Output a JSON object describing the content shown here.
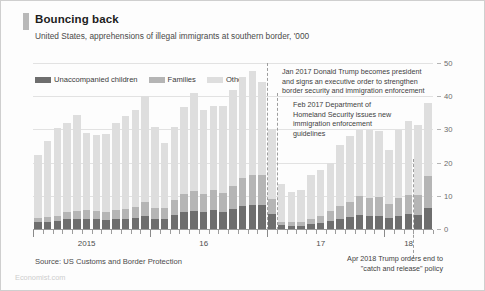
{
  "header": {
    "title": "Bouncing back",
    "subtitle": "United States, apprehensions of illegal immigrants at southern border, '000"
  },
  "legend": {
    "items": [
      {
        "label": "Unaccompanied children",
        "color": "#6e6e6e"
      },
      {
        "label": "Families",
        "color": "#b5b5b5"
      },
      {
        "label": "Other",
        "color": "#dedede"
      }
    ]
  },
  "annotations": [
    {
      "name": "jan-2017",
      "text": "Jan 2017 Donald Trump becomes president and signs an executive order to strengthen border security and immigration enforcement"
    },
    {
      "name": "feb-2017",
      "text": "Feb 2017 Department of Homeland Security issues new immigration enforcement guidelines"
    },
    {
      "name": "apr-2018",
      "text": "Apr 2018 Trump orders end to \"catch and release\" policy"
    }
  ],
  "source": "Source: US Customs and Border Protection",
  "brand": "Economist.com",
  "chart_data": {
    "type": "bar",
    "subtype": "stacked-column",
    "title": "Bouncing back",
    "subtitle": "United States, apprehensions of illegal immigrants at southern border, '000",
    "xlabel": "",
    "ylabel": "'000",
    "ylim": [
      0,
      50
    ],
    "yticks": [
      0,
      10,
      20,
      30,
      40,
      50
    ],
    "yaxis_position": "right",
    "grid": true,
    "legend_position": "top-left",
    "categories": [
      "Jan 2015",
      "Feb 2015",
      "Mar 2015",
      "Apr 2015",
      "May 2015",
      "Jun 2015",
      "Jul 2015",
      "Aug 2015",
      "Sep 2015",
      "Oct 2015",
      "Nov 2015",
      "Dec 2015",
      "Jan 2016",
      "Feb 2016",
      "Mar 2016",
      "Apr 2016",
      "May 2016",
      "Jun 2016",
      "Jul 2016",
      "Aug 2016",
      "Sep 2016",
      "Oct 2016",
      "Nov 2016",
      "Dec 2016",
      "Jan 2017",
      "Feb 2017",
      "Mar 2017",
      "Apr 2017",
      "May 2017",
      "Jun 2017",
      "Jul 2017",
      "Aug 2017",
      "Sep 2017",
      "Oct 2017",
      "Nov 2017",
      "Dec 2017",
      "Jan 2018",
      "Feb 2018",
      "Mar 2018",
      "Apr 2018",
      "May 2018"
    ],
    "series": [
      {
        "name": "Unaccompanied children",
        "color": "#6e6e6e",
        "values": [
          2.1,
          2.2,
          2.4,
          2.9,
          3.1,
          3.0,
          2.9,
          2.8,
          3.1,
          3.0,
          3.3,
          3.9,
          3.1,
          3.1,
          4.2,
          5.2,
          5.4,
          5.2,
          5.8,
          5.2,
          6.0,
          6.9,
          7.3,
          7.3,
          4.4,
          1.1,
          1.0,
          1.0,
          1.4,
          1.8,
          2.3,
          3.0,
          3.6,
          4.2,
          4.0,
          4.0,
          3.2,
          4.0,
          4.4,
          4.3,
          6.4
        ]
      },
      {
        "name": "Families",
        "color": "#b5b5b5",
        "values": [
          1.2,
          1.4,
          1.6,
          2.1,
          2.3,
          2.6,
          2.4,
          2.2,
          2.6,
          2.9,
          3.3,
          4.2,
          3.1,
          3.1,
          4.5,
          5.4,
          6.1,
          5.3,
          6.1,
          5.7,
          7.0,
          8.5,
          9.0,
          8.9,
          4.5,
          1.1,
          1.1,
          1.1,
          1.7,
          2.2,
          3.0,
          3.8,
          4.5,
          5.6,
          5.4,
          5.5,
          4.3,
          5.4,
          6.0,
          6.0,
          9.5
        ]
      },
      {
        "name": "Other",
        "color": "#dedede",
        "values": [
          19.0,
          22.9,
          26.5,
          26.9,
          28.9,
          23.4,
          22.9,
          23.6,
          26.1,
          28.0,
          29.4,
          32.0,
          24.4,
          19.8,
          22.1,
          26.3,
          29.6,
          25.3,
          25.1,
          26.2,
          29.0,
          30.5,
          31.2,
          28.1,
          21.1,
          11.3,
          9.1,
          9.7,
          13.1,
          13.8,
          14.7,
          18.4,
          19.9,
          20.0,
          20.4,
          20.0,
          16.4,
          20.3,
          22.2,
          21.1,
          22.1
        ]
      }
    ],
    "totals": [
      22.3,
      26.5,
      30.5,
      31.9,
      34.3,
      29.0,
      28.2,
      28.6,
      31.8,
      33.9,
      36.0,
      40.1,
      30.6,
      26.0,
      30.8,
      36.9,
      41.1,
      35.8,
      37.0,
      37.1,
      42.0,
      45.9,
      47.5,
      44.3,
      30.0,
      13.5,
      11.2,
      11.8,
      16.2,
      17.8,
      20.0,
      25.2,
      28.0,
      29.8,
      29.8,
      29.5,
      23.9,
      29.7,
      32.6,
      31.4,
      38.0
    ],
    "event_markers": [
      {
        "label": "Jan 2017",
        "category_index": 24
      },
      {
        "label": "Feb 2017",
        "category_index": 25
      },
      {
        "label": "Apr 2018",
        "category_index": 39
      }
    ],
    "xtick_labels": [
      {
        "label": "2015",
        "category_index": 5
      },
      {
        "label": "16",
        "category_index": 17
      },
      {
        "label": "17",
        "category_index": 29
      },
      {
        "label": "18",
        "category_index": 38
      }
    ]
  }
}
